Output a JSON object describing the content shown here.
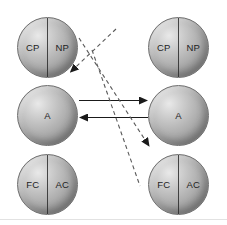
{
  "diagram": {
    "columns": [
      {
        "name": "left-column",
        "spheres": [
          {
            "id": "left-top",
            "type": "split",
            "left_label": "CP",
            "right_label": "NP"
          },
          {
            "id": "left-mid",
            "type": "single",
            "label": "A"
          },
          {
            "id": "left-bottom",
            "type": "split",
            "left_label": "FC",
            "right_label": "AC"
          }
        ]
      },
      {
        "name": "right-column",
        "spheres": [
          {
            "id": "right-top",
            "type": "split",
            "left_label": "CP",
            "right_label": "NP"
          },
          {
            "id": "right-mid",
            "type": "single",
            "label": "A"
          },
          {
            "id": "right-bottom",
            "type": "split",
            "left_label": "FC",
            "right_label": "AC"
          }
        ]
      }
    ],
    "connections": [
      {
        "id": "solid-right",
        "style": "solid",
        "direction": "left-A-to-right-A",
        "arrowhead": "right"
      },
      {
        "id": "solid-left",
        "style": "solid",
        "direction": "right-A-to-left-A",
        "arrowhead": "left"
      },
      {
        "id": "dashed-upper",
        "style": "dashed",
        "direction": "right-FC-AC-to-left-NP",
        "arrowhead": "upper-left"
      },
      {
        "id": "dashed-lower",
        "style": "dashed",
        "direction": "left-NP-to-right-FC-AC",
        "arrowhead": "lower-right"
      }
    ],
    "colors": {
      "sphere_light": "#e9e9e9",
      "sphere_mid": "#ababab",
      "sphere_dark": "#8a8a8a",
      "outline": "#6f6f6f",
      "divider": "#2a2a2a",
      "label_text": "#1d1d1d",
      "solid_arrow": "#1a1a1a",
      "dashed_arrow": "#555555",
      "background": "#ffffff"
    }
  }
}
